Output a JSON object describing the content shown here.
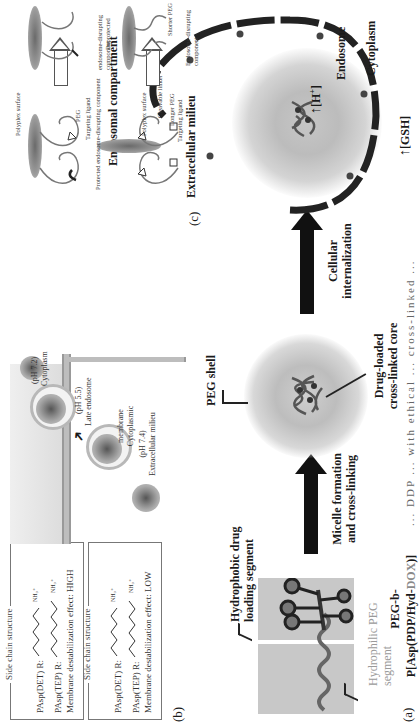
{
  "figure": {
    "orientation": "rotated 90deg counterclockwise",
    "panel_a": {
      "label": "(a)",
      "hydrophilic_segment_label": "Hydrophilic PEG segment",
      "hydrophobic_segment_label_line1": "Hydrophobic drug",
      "hydrophobic_segment_label_line2": "loading segment",
      "polymer_name_line1": "PEG-b-",
      "polymer_name_line2_prefix": "P[Asp(PDP/Hyd-",
      "polymer_name_line2_dox": "DOX",
      "polymer_name_line2_suffix": ")]",
      "step1_line1": "Micelle formation",
      "step1_line2": "and cross-linking",
      "shell_label": "PEG shell",
      "core_label_line1": "Drug-loaded",
      "core_label_line2": "cross-linked core",
      "step2_line1": "Cellular",
      "step2_line2": "internalization",
      "cytoplasm_label": "Cytoplasm",
      "endosome_label": "Endosome",
      "gsh_label": "[GSH]",
      "h_label": "[H",
      "h_sup": "+",
      "h_close": "]"
    },
    "panel_b": {
      "label": "(b)",
      "box1": {
        "title": "Side chain structure",
        "row1_label": "PAsp(DET) R:",
        "row2_label": "PAsp(TEP) R:",
        "effect": "Membrane destabilization effect: LOW"
      },
      "box2": {
        "title": "Side chain structure",
        "row1_label": "PAsp(DET) R:",
        "row2_label": "PAsp(TEP) R:",
        "effect": "Membrane destabilization effect: HIGH"
      },
      "extracellular_label": "Extracellular milieu",
      "extracellular_ph": "(pH 7.4)",
      "membrane_label_line1": "Cytoplasmic",
      "membrane_label_line2": "membrane",
      "late_endosome_label": "Late endosome",
      "late_endosome_ph": "(pH 5.5)",
      "cytoplasm_label": "Cytoplasm",
      "cytoplasm_ph": "(pH 7.2)"
    },
    "panel_c": {
      "label": "(c)",
      "extracellular_title": "Extracellular milieu",
      "endosomal_title": "Endosomal compartment",
      "top_left": {
        "targeting_ligand": "Targeting ligand",
        "longer_peg": "Longer PEG",
        "cleavable_linker": "Cleavable linker",
        "polyplex_surface": "Polyplex surface"
      },
      "top_right": {
        "endosome_disrupting": "Endosome-disrupting component",
        "shorter_peg": "Shorter PEG"
      },
      "bottom_left": {
        "protected_component": "Protected endosome-disrupting component",
        "targeting_ligand": "Targeting ligand",
        "peg": "PEG",
        "polyplex_surface": "Polyplex surface"
      },
      "bottom_right": {
        "deprotected_line1": "Deprotected",
        "deprotected_line2": "endosome-disrupting component"
      }
    },
    "caption_fragment": "... DDP ... with ethical ... cross-linked ...",
    "colors": {
      "ink": "#1a1a1a",
      "grey_text": "#9a9a9a",
      "dox_text": "#8a8a8a",
      "shade": "#c8c8c8"
    }
  }
}
